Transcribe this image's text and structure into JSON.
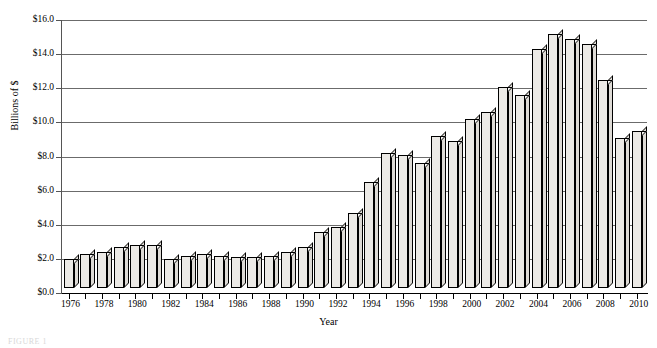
{
  "chart_data": {
    "type": "bar",
    "title": "",
    "xlabel": "Year",
    "ylabel": "Billions of $",
    "ylim": [
      0,
      16
    ],
    "ytick_values": [
      0,
      2,
      4,
      6,
      8,
      10,
      12,
      14,
      16
    ],
    "ytick_labels": [
      "$0.0",
      "$2.0",
      "$4.0",
      "$6.0",
      "$8.0",
      "$10.0",
      "$12.0",
      "$14.0",
      "$16.0"
    ],
    "grid": true,
    "legend": null,
    "xtick_labels": [
      "1976",
      "1978",
      "1980",
      "1982",
      "1984",
      "1986",
      "1988",
      "1990",
      "1992",
      "1994",
      "1996",
      "1998",
      "2000",
      "2002",
      "2004",
      "2006",
      "2008",
      "2010"
    ],
    "categories": [
      "1976",
      "1977",
      "1978",
      "1979",
      "1980",
      "1981",
      "1982",
      "1983",
      "1984",
      "1985",
      "1986",
      "1987",
      "1988",
      "1989",
      "1990",
      "1991",
      "1992",
      "1993",
      "1994",
      "1995",
      "1996",
      "1997",
      "1998",
      "1999",
      "2000",
      "2001",
      "2002",
      "2003",
      "2004",
      "2005",
      "2006",
      "2007",
      "2008",
      "2009",
      "2010"
    ],
    "values": [
      1.7,
      2.0,
      2.1,
      2.4,
      2.5,
      2.5,
      1.7,
      1.9,
      2.0,
      1.9,
      1.8,
      1.8,
      1.9,
      2.1,
      2.4,
      3.3,
      3.6,
      4.4,
      6.2,
      7.9,
      7.8,
      7.3,
      8.9,
      8.6,
      9.9,
      10.3,
      11.8,
      11.3,
      14.0,
      14.9,
      14.6,
      14.3,
      12.2,
      8.8,
      9.2
    ]
  },
  "caption": "FIGURE 1"
}
